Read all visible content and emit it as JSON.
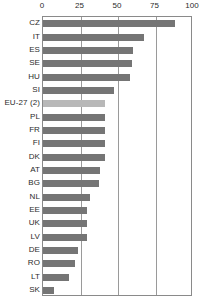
{
  "chart_data": {
    "type": "bar",
    "orientation": "horizontal",
    "title": "",
    "subtitle": "",
    "xlabel": "",
    "ylabel": "",
    "xlim": [
      0,
      100
    ],
    "ticks": [
      "0",
      "25",
      "50",
      "75",
      "100"
    ],
    "tick_values": [
      0,
      25,
      50,
      75,
      100
    ],
    "grid": true,
    "legend": null,
    "categories": [
      "CZ",
      "IT",
      "ES",
      "SE",
      "HU",
      "SI",
      "EU-27 (2)",
      "PL",
      "FR",
      "FI",
      "DK",
      "AT",
      "BG",
      "NL",
      "EE",
      "UK",
      "LV",
      "DE",
      "RO",
      "LT",
      "SK"
    ],
    "values": [
      88,
      67,
      60,
      59,
      58,
      47,
      41,
      41,
      41,
      41,
      41,
      38,
      37,
      31,
      29,
      29,
      29,
      23,
      21,
      17,
      7
    ],
    "highlight_category": "EU-27 (2)",
    "bar_color": "#757575",
    "highlight_color": "#b8b8b8",
    "axis_color": "#8a8a8a",
    "grid_color": "#9a9a9a",
    "text_color": "#2b2b2b"
  }
}
